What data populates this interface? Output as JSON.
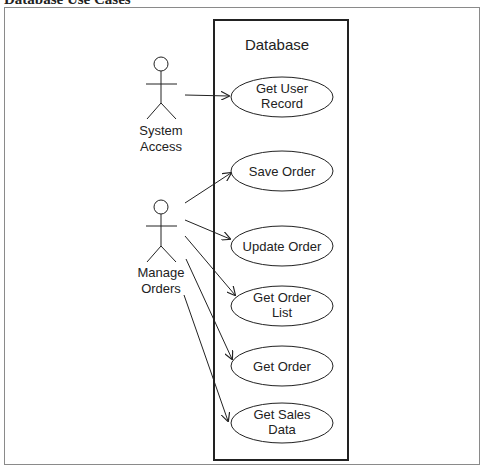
{
  "caption": "Database Use Cases",
  "system": {
    "label": "Database"
  },
  "actors": [
    {
      "label_line1": "System",
      "label_line2": "Access"
    },
    {
      "label_line1": "Manage",
      "label_line2": "Orders"
    }
  ],
  "use_cases": [
    {
      "line1": "Get User",
      "line2": "Record"
    },
    {
      "line1": "Save Order",
      "line2": ""
    },
    {
      "line1": "Update Order",
      "line2": ""
    },
    {
      "line1": "Get Order",
      "line2": "List"
    },
    {
      "line1": "Get Order",
      "line2": ""
    },
    {
      "line1": "Get Sales",
      "line2": "Data"
    }
  ],
  "colors": {
    "line": "#222222",
    "frame": "#8a8a8a"
  }
}
